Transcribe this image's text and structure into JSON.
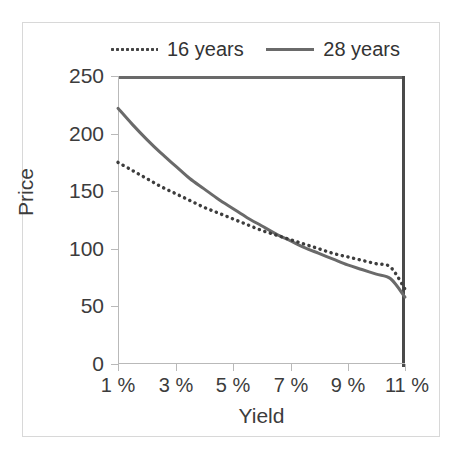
{
  "figure": {
    "background_color": "#ffffff",
    "frame_color": "#d8d8d8"
  },
  "legend": {
    "position": "top-center",
    "entries": [
      {
        "label": "16 years",
        "style": "dotted",
        "color": "#444444"
      },
      {
        "label": "28 years",
        "style": "solid",
        "color": "#6a6a6a"
      }
    ]
  },
  "axes": {
    "x_title": "Yield",
    "y_title": "Price",
    "x_ticklabels": [
      "1 %",
      "3 %",
      "5 %",
      "7 %",
      "9 %",
      "11 %"
    ],
    "y_ticklabels": [
      "0",
      "50",
      "100",
      "150",
      "200",
      "250"
    ]
  },
  "chart_data": {
    "type": "line",
    "title": "",
    "xlabel": "Yield",
    "ylabel": "Price",
    "xlim": [
      1,
      11
    ],
    "ylim": [
      0,
      250
    ],
    "xtick_values": [
      1,
      3,
      5,
      7,
      9,
      11
    ],
    "ytick_values": [
      0,
      50,
      100,
      150,
      200,
      250
    ],
    "xtick_labels": [
      "1 %",
      "3 %",
      "5 %",
      "7 %",
      "9 %",
      "11 %"
    ],
    "ytick_labels": [
      "0",
      "50",
      "100",
      "150",
      "200",
      "250"
    ],
    "grid": false,
    "legend_position": "top-center",
    "x": [
      1,
      1.5,
      2,
      2.5,
      3,
      3.5,
      4,
      4.5,
      5,
      5.5,
      6,
      6.5,
      7,
      7.5,
      8,
      8.5,
      9,
      9.5,
      10,
      10.5,
      11
    ],
    "series": [
      {
        "name": "16 years",
        "style": "dotted",
        "color": "#444444",
        "values": [
          175,
          168,
          161,
          154,
          148,
          142,
          136,
          131,
          126,
          121,
          116,
          112,
          108,
          104,
          100,
          96,
          93,
          90,
          87,
          84,
          65
        ]
      },
      {
        "name": "28 years",
        "style": "solid",
        "color": "#6a6a6a",
        "values": [
          222,
          208,
          195,
          183,
          172,
          161,
          152,
          143,
          135,
          127,
          120,
          113,
          107,
          101,
          96,
          91,
          86,
          82,
          78,
          74,
          58
        ]
      }
    ]
  }
}
